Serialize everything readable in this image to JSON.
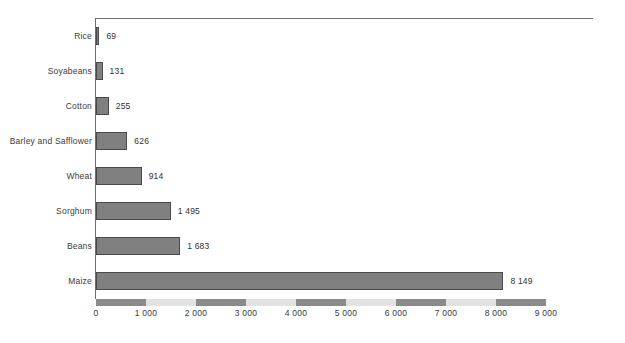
{
  "chart_data": {
    "type": "bar",
    "orientation": "horizontal",
    "title": "",
    "subtitle": "",
    "xlabel": "",
    "ylabel": "",
    "categories": [
      "Rice",
      "Soyabeans",
      "Cotton",
      "Barley and Safflower",
      "Wheat",
      "Sorghum",
      "Beans",
      "Maize"
    ],
    "values": [
      69,
      131,
      255,
      626,
      914,
      1495,
      1683,
      8149
    ],
    "value_labels": [
      "69",
      "131",
      "255",
      "626",
      "914",
      "1 495",
      "1 683",
      "8 149"
    ],
    "xlim": [
      0,
      9000
    ],
    "xticks": [
      0,
      1000,
      2000,
      3000,
      4000,
      5000,
      6000,
      7000,
      8000,
      9000
    ],
    "xtick_labels": [
      "0",
      "1 000",
      "2 000",
      "3 000",
      "4 000",
      "5 000",
      "6 000",
      "7 000",
      "8 000",
      "9 000"
    ],
    "grid": false,
    "legend": "none",
    "bar_fill_color": "#808080",
    "bar_edge_color": "#4a4a4a",
    "axis_line_color": "#6e6e6e",
    "axis_band_dark_color": "#8a8a8a",
    "axis_band_light_color": "#e2e2e2",
    "axis_band_segments": [
      "dark",
      "light",
      "dark",
      "light",
      "dark",
      "light",
      "dark",
      "light",
      "dark"
    ],
    "background_color": "#ffffff"
  }
}
